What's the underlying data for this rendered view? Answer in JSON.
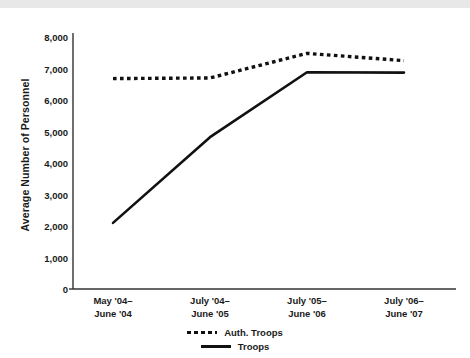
{
  "chart_data": {
    "type": "line",
    "title": "",
    "xlabel": "",
    "ylabel": "Average Number of Personnel",
    "categories": [
      "May '04–\nJune '04",
      "July '04–\nJune '05",
      "July '05–\nJune '06",
      "July '06–\nJune '07"
    ],
    "category_lines": [
      [
        "May '04–",
        "June '04"
      ],
      [
        "July '04–",
        "June '05"
      ],
      [
        "July '05–",
        "June '06"
      ],
      [
        "July '06–",
        "June '07"
      ]
    ],
    "series": [
      {
        "name": "Auth. Troops",
        "style": "dashed",
        "color": "#111111",
        "values": [
          6680,
          6700,
          7480,
          7250
        ]
      },
      {
        "name": "Troops",
        "style": "solid",
        "color": "#111111",
        "values": [
          2100,
          4820,
          6880,
          6870
        ]
      }
    ],
    "ylim": [
      0,
      8000
    ],
    "ytick_values": [
      0,
      1000,
      2000,
      3000,
      4000,
      5000,
      6000,
      7000,
      8000
    ],
    "ytick_labels": [
      "0",
      "1,000",
      "2,000",
      "3,000",
      "4,000",
      "5,000",
      "6,000",
      "7,000",
      "8,000"
    ],
    "grid": false,
    "legend_position": "bottom-center"
  },
  "legend": {
    "entries": [
      {
        "label": "Auth. Troops",
        "style": "dashed"
      },
      {
        "label": "Troops",
        "style": "solid"
      }
    ]
  },
  "colors": {
    "line": "#111111",
    "axis": "#333333",
    "text": "#1a1a1a",
    "background": "#ffffff",
    "top_strip": "#e8e8e8"
  }
}
